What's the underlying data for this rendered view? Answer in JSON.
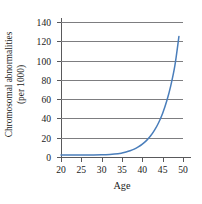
{
  "chart_data": {
    "type": "line",
    "title": "",
    "xlabel": "Age",
    "ylabel": "Chromosomal abnormalities (per 1000)",
    "ylabel_line1": "Chromosomal abnormalities",
    "ylabel_line2": "(per 1000)",
    "xlim": [
      20,
      50
    ],
    "ylim": [
      0,
      140
    ],
    "xticks": [
      20,
      25,
      30,
      35,
      40,
      45,
      50
    ],
    "xtick_labels": [
      "20",
      "25",
      "30",
      "35",
      "40",
      "45",
      "50"
    ],
    "yticks": [
      0,
      20,
      40,
      60,
      80,
      100,
      120,
      140
    ],
    "ytick_labels": [
      "0",
      "20",
      "40",
      "60",
      "80",
      "100",
      "120",
      "140"
    ],
    "grid": "horizontal",
    "legend": "none",
    "series": [
      {
        "name": "Chromosomal abnormalities per 1000",
        "color": "#4a7ebb",
        "x": [
          20,
          22,
          24,
          26,
          28,
          30,
          32,
          34,
          35,
          36,
          37,
          38,
          39,
          40,
          41,
          42,
          43,
          44,
          45,
          46,
          47,
          48,
          49
        ],
        "values": [
          2,
          2,
          2,
          2,
          2.1,
          2.3,
          2.7,
          3.4,
          4.1,
          5.1,
          6.4,
          8.1,
          10.4,
          13.3,
          17,
          21.7,
          27.8,
          35.5,
          45.4,
          58,
          74.1,
          94.7,
          125
        ]
      }
    ],
    "colors": {
      "curve": "#4a7ebb",
      "grid": "#7d7d80",
      "axis": "#59595b",
      "text": "#1a1a1a",
      "background": "#ffffff"
    }
  }
}
